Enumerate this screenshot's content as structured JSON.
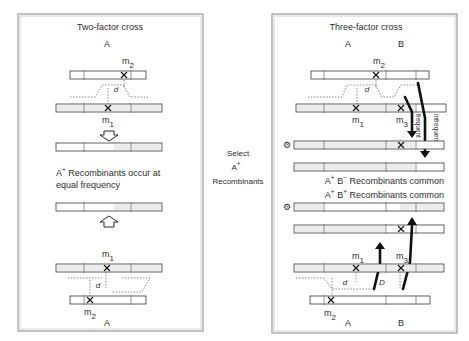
{
  "left_panel": {
    "title": "Two-factor cross",
    "gene_label_top": "A",
    "gene_label_bottom": "A",
    "marker_m1": "m",
    "marker_m1_sub": "1",
    "marker_m2": "m",
    "marker_m2_sub": "2",
    "distance_label": "d",
    "result_line1_prefix": "A",
    "result_line1_sup": "+",
    "result_line1_rest": " Recombinants  occur at",
    "result_line2": "equal frequency"
  },
  "middle": {
    "line1": "Select",
    "line2": "A",
    "line2_sup": "+",
    "line3": "Recombinants"
  },
  "right_panel": {
    "title": "Three-factor cross",
    "gene_label_a_top": "A",
    "gene_label_b_top": "B",
    "gene_label_a_bottom": "A",
    "gene_label_b_bottom": "B",
    "marker_m": "m",
    "sub_1": "1",
    "sub_2": "2",
    "sub_3": "3",
    "distance_small": "d",
    "distance_large": "D",
    "frequent_label": "frequent",
    "infrequent_label": "infrequent",
    "result_ab_minus_a": "A",
    "result_ab_minus_a_sup": "+",
    "result_ab_minus_b": " B",
    "result_ab_minus_b_sup": "−",
    "result_ab_minus_rest": " Recombinants  common",
    "result_ab_plus_a": "A",
    "result_ab_plus_a_sup": "+",
    "result_ab_plus_b": " B",
    "result_ab_plus_b_sup": "+",
    "result_ab_plus_rest": " Recombinants  common",
    "selected_marker_icon": "gear-icon"
  },
  "colors": {
    "frame": "#9a9a9a",
    "line": "#2a2a2a",
    "text": "#2d2d2d",
    "shade": "#ececec"
  }
}
